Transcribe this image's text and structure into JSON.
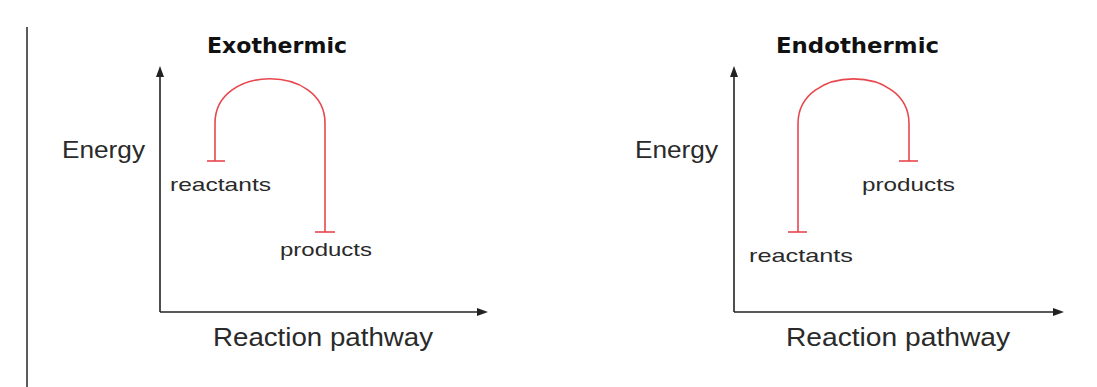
{
  "colors": {
    "curve": "#e8474e",
    "axis": "#222222",
    "text": "#2a2a2a",
    "title": "#111111"
  },
  "left_border": {
    "x": 27,
    "y1": 27,
    "y2": 387
  },
  "diagrams": [
    {
      "id": "exothermic",
      "title": "Exothermic",
      "title_pos": {
        "x": 207,
        "y": 53,
        "size": 22,
        "width": 140
      },
      "y_axis_label": "Energy",
      "y_label_pos": {
        "x": 62,
        "y": 158,
        "size": 24,
        "width": 83
      },
      "x_axis_label": "Reaction pathway",
      "x_label_pos": {
        "x": 213,
        "y": 346,
        "size": 25,
        "width": 220
      },
      "axes": {
        "origin_x": 160,
        "origin_y": 312,
        "y_top": 66,
        "x_right": 488
      },
      "curve": {
        "left_x": 215,
        "right_x": 325,
        "top_y": 68,
        "left_end_y": 161,
        "right_end_y": 232
      },
      "bars": [
        {
          "x1": 207,
          "x2": 225,
          "y": 161
        },
        {
          "x1": 315,
          "x2": 335,
          "y": 232
        }
      ],
      "labels": [
        {
          "text": "reactants",
          "x": 170,
          "y": 191,
          "size": 19,
          "width": 101
        },
        {
          "text": "products",
          "x": 280,
          "y": 256,
          "size": 19,
          "width": 92
        }
      ]
    },
    {
      "id": "endothermic",
      "title": "Endothermic",
      "title_pos": {
        "x": 776,
        "y": 53,
        "size": 22,
        "width": 163
      },
      "y_axis_label": "Energy",
      "y_label_pos": {
        "x": 635,
        "y": 158,
        "size": 24,
        "width": 83
      },
      "x_axis_label": "Reaction pathway",
      "x_label_pos": {
        "x": 786,
        "y": 346,
        "size": 25,
        "width": 224
      },
      "axes": {
        "origin_x": 734,
        "origin_y": 312,
        "y_top": 66,
        "x_right": 1064
      },
      "curve": {
        "left_x": 798,
        "right_x": 909,
        "top_y": 68,
        "left_end_y": 232,
        "right_end_y": 161
      },
      "bars": [
        {
          "x1": 788,
          "x2": 807,
          "y": 232
        },
        {
          "x1": 899,
          "x2": 918,
          "y": 161
        }
      ],
      "labels": [
        {
          "text": "products",
          "x": 862,
          "y": 191,
          "size": 19,
          "width": 93
        },
        {
          "text": "reactants",
          "x": 749,
          "y": 262,
          "size": 19,
          "width": 104
        }
      ]
    }
  ]
}
